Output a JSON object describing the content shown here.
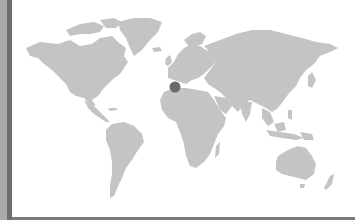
{
  "map": {
    "type": "world-map",
    "land_color": "#c4c4c4",
    "ocean_color": "#ffffff",
    "marker_color": "#6a6a6a",
    "markers": [
      {
        "name": "location-marker",
        "x": 175,
        "y": 87,
        "region": "Spain / Western Mediterranean"
      }
    ]
  },
  "frame": {
    "left_strip_light": "#a9a9a9",
    "left_strip_dark": "#6e6e6e",
    "bottom_border": "#7a7a7a"
  }
}
